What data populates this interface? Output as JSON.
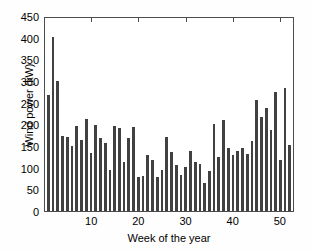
{
  "chart_data": {
    "type": "bar",
    "title": "",
    "xlabel": "Week of the year",
    "ylabel": "Wind power (kW)",
    "xlim": [
      0,
      53
    ],
    "ylim": [
      0,
      450
    ],
    "yticks": [
      0,
      50,
      100,
      150,
      200,
      250,
      300,
      350,
      400,
      450
    ],
    "ytick_labels": [
      "0",
      "50",
      "100",
      "150",
      "200",
      "250",
      "300",
      "350",
      "400",
      "450"
    ],
    "xticks": [
      10,
      20,
      30,
      40,
      50
    ],
    "xtick_labels": [
      "10",
      "20",
      "30",
      "40",
      "50"
    ],
    "grid": false,
    "legend": null,
    "bar_color": "#414141",
    "axis_color": "#4d4d4d",
    "categories": [
      1,
      2,
      3,
      4,
      5,
      6,
      7,
      8,
      9,
      10,
      11,
      12,
      13,
      14,
      15,
      16,
      17,
      18,
      19,
      20,
      21,
      22,
      23,
      24,
      25,
      26,
      27,
      28,
      29,
      30,
      31,
      32,
      33,
      34,
      35,
      36,
      37,
      38,
      39,
      40,
      41,
      42,
      43,
      44,
      45,
      46,
      47,
      48,
      49,
      50,
      51,
      52
    ],
    "values": [
      270,
      405,
      302,
      175,
      172,
      152,
      198,
      165,
      215,
      135,
      200,
      170,
      159,
      95,
      198,
      194,
      115,
      170,
      196,
      80,
      82,
      131,
      118,
      80,
      96,
      172,
      137,
      107,
      84,
      103,
      140,
      115,
      110,
      65,
      93,
      203,
      125,
      212,
      148,
      130,
      140,
      146,
      134,
      164,
      258,
      219,
      240,
      188,
      277,
      120,
      286,
      155
    ]
  }
}
